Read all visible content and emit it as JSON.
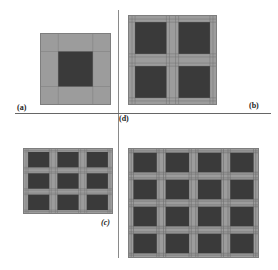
{
  "figure": {
    "panels": [
      {
        "id": "a",
        "label": "(a)",
        "cells": 1,
        "description": "single dark square centered in light grid"
      },
      {
        "id": "b",
        "label": "(b)",
        "cells": 2,
        "description": "2x2 array of dark squares"
      },
      {
        "id": "c",
        "label": "(c)",
        "cells": 3,
        "description": "3x3 array of dark squares"
      },
      {
        "id": "d",
        "label": "(d)",
        "cells": 4,
        "description": "4x4 array of dark squares"
      }
    ],
    "colors": {
      "background": "#ffffff",
      "light_cell": "#9c9c9c",
      "dark_cell": "#3a3a3a",
      "grid_line": "#6e6e6e",
      "divider": "#8a8a8a"
    }
  }
}
